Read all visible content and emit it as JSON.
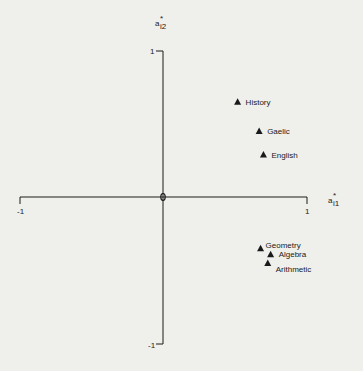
{
  "chart_data": {
    "type": "scatter",
    "title": "",
    "xlabel": "a*_i1",
    "ylabel": "a*_i2",
    "xlim": [
      -1,
      1
    ],
    "ylim": [
      -1,
      1
    ],
    "grid": false,
    "legend": null,
    "marker": "triangle",
    "origin_label": "0",
    "x_ticks": [
      "-1",
      "1"
    ],
    "y_ticks": [
      "1",
      "-1"
    ],
    "points": [
      {
        "label": "History",
        "x": 0.52,
        "y": 0.65
      },
      {
        "label": "Gaelic",
        "x": 0.67,
        "y": 0.45
      },
      {
        "label": "English",
        "x": 0.7,
        "y": 0.29
      },
      {
        "label": "Geometry",
        "x": 0.68,
        "y": -0.35
      },
      {
        "label": "Algebra",
        "x": 0.75,
        "y": -0.39
      },
      {
        "label": "Arithmetic",
        "x": 0.73,
        "y": -0.45
      }
    ]
  },
  "axes": {
    "x_label_main": "a",
    "x_label_sup": "*",
    "x_label_sub": "i1",
    "y_label_main": "a",
    "y_label_sup": "*",
    "y_label_sub": "i2",
    "x_min_label": "-1",
    "x_max_label": "1",
    "y_max_label": "1",
    "y_min_label": "-1"
  },
  "colors": {
    "background": "#efefec",
    "ink": "#1a1a1a"
  }
}
